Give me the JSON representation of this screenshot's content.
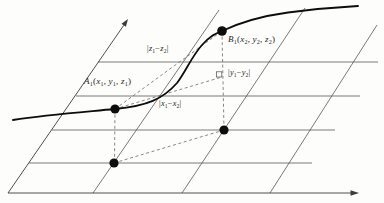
{
  "figure": {
    "style": {
      "background": "#fdfdfc",
      "grid_color": "#4d4d4d",
      "axis_color": "#3c3c3c",
      "dashed_color": "#6a6a6a",
      "curve_color": "#0d0d0d",
      "dot_color": "#0d0d0d",
      "label_color": "#1f1f1f"
    },
    "geometry": {
      "axes": [
        {
          "name": "x-axis",
          "x1": 8,
          "y1": 193,
          "x2": 352,
          "y2": 193,
          "arrow": [
            [
              359,
              193
            ],
            [
              350.5,
              190.3
            ],
            [
              350.5,
              195.7
            ]
          ]
        },
        {
          "name": "y-axis",
          "x1": 8,
          "y1": 193,
          "x2": 123.8,
          "y2": 25.2,
          "arrow": [
            [
              128,
              19
            ],
            [
              125.9,
              26.7
            ],
            [
              121.5,
              23.7
            ]
          ]
        }
      ],
      "grid_horizontal": [
        {
          "name": "grid-h-1",
          "x1": 98,
          "y1": 62,
          "x2": 378,
          "y2": 62
        },
        {
          "name": "grid-h-2",
          "x1": 76,
          "y1": 96,
          "x2": 360,
          "y2": 96
        },
        {
          "name": "grid-h-3",
          "x1": 52,
          "y1": 130,
          "x2": 335,
          "y2": 130
        },
        {
          "name": "grid-h-4",
          "x1": 29,
          "y1": 163,
          "x2": 312,
          "y2": 163
        }
      ],
      "grid_slant": [
        {
          "name": "grid-s-1",
          "x1": 93,
          "y1": 193,
          "x2": 219,
          "y2": 10
        },
        {
          "name": "grid-s-2",
          "x1": 182,
          "y1": 193,
          "x2": 305,
          "y2": 8
        },
        {
          "name": "grid-s-3",
          "x1": 270,
          "y1": 193,
          "x2": 377,
          "y2": 25
        }
      ],
      "dashed": [
        {
          "name": "projection-a1-a0",
          "x1": 115,
          "y1": 109,
          "x2": 114.5,
          "y2": 163
        },
        {
          "name": "projection-b1-b0",
          "x1": 222,
          "y1": 31,
          "x2": 224,
          "y2": 130
        },
        {
          "name": "plane-chord-a0-b0",
          "x1": 114,
          "y1": 163,
          "x2": 224,
          "y2": 130
        },
        {
          "name": "space-chord-a1-b1",
          "x1": 115,
          "y1": 109,
          "x2": 222,
          "y2": 31
        },
        {
          "name": "delta-segment-a1-c",
          "x1": 115,
          "y1": 109,
          "x2": 222,
          "y2": 77
        }
      ],
      "curve": "M13,120 C48,114.5 84,112 115,109 C147,106 163,99 177,83 C186,71 192,56 202,45 C210,36 214,34.5 222,31 C240,22.5 262,16 288,12.5 C315,9 340,7 358,6",
      "dots": [
        {
          "name": "dot-a1",
          "cx": 115,
          "cy": 109,
          "r": 4.6
        },
        {
          "name": "dot-b1",
          "cx": 222,
          "cy": 31,
          "r": 4.8
        },
        {
          "name": "dot-a0",
          "cx": 114,
          "cy": 163,
          "r": 4.6
        },
        {
          "name": "dot-b0",
          "cx": 224,
          "cy": 130,
          "r": 4.6
        }
      ],
      "right_angle": {
        "x": 216.6,
        "y": 71.8,
        "size": 5.2
      }
    },
    "labels": {
      "point_a": {
        "left": 84,
        "top": 76,
        "parts": [
          [
            "i",
            "A"
          ],
          [
            "s",
            "1"
          ],
          [
            "n",
            "("
          ],
          [
            "i",
            "x"
          ],
          [
            "s",
            "1"
          ],
          [
            "n",
            ", "
          ],
          [
            "i",
            "y"
          ],
          [
            "s",
            "1"
          ],
          [
            "n",
            ", "
          ],
          [
            "i",
            "z"
          ],
          [
            "s",
            "1"
          ],
          [
            "n",
            ")"
          ]
        ]
      },
      "point_b": {
        "left": 228,
        "top": 34,
        "parts": [
          [
            "i",
            "B"
          ],
          [
            "s",
            "1"
          ],
          [
            "n",
            "("
          ],
          [
            "i",
            "x"
          ],
          [
            "s",
            "2"
          ],
          [
            "n",
            ", "
          ],
          [
            "i",
            "y"
          ],
          [
            "s",
            "2"
          ],
          [
            "n",
            ", "
          ],
          [
            "i",
            "z"
          ],
          [
            "s",
            "2"
          ],
          [
            "n",
            ")"
          ]
        ]
      },
      "delta_z": {
        "left": 147,
        "top": 44,
        "parts": [
          [
            "n",
            "|"
          ],
          [
            "i",
            "z"
          ],
          [
            "s",
            "1"
          ],
          [
            "n",
            "−"
          ],
          [
            "i",
            "z"
          ],
          [
            "s",
            "2"
          ],
          [
            "n",
            "|"
          ]
        ]
      },
      "delta_y": {
        "left": 228,
        "top": 68,
        "parts": [
          [
            "n",
            "|"
          ],
          [
            "i",
            "y"
          ],
          [
            "s",
            "1"
          ],
          [
            "n",
            "−"
          ],
          [
            "i",
            "y"
          ],
          [
            "s",
            "2"
          ],
          [
            "n",
            "|"
          ]
        ]
      },
      "delta_x": {
        "left": 159,
        "top": 99,
        "parts": [
          [
            "n",
            "|"
          ],
          [
            "i",
            "x"
          ],
          [
            "s",
            "1"
          ],
          [
            "n",
            "−"
          ],
          [
            "i",
            "x"
          ],
          [
            "s",
            "2"
          ],
          [
            "n",
            "|"
          ]
        ]
      }
    }
  }
}
